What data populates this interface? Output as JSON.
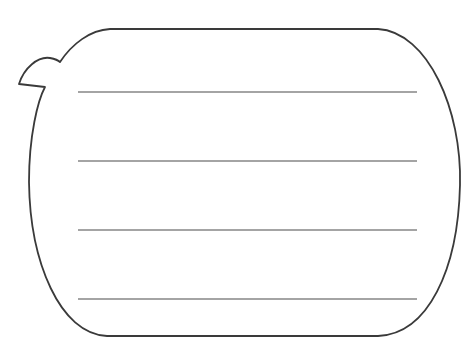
{
  "figure": {
    "type": "speech-bubble-writing-template",
    "stroke_color": "#3a3a3a",
    "line_color": "#4a4a4a",
    "background": "#ffffff",
    "ruled_line_count": 4,
    "ruled_lines_y": [
      92,
      161,
      230,
      299
    ],
    "ruled_line_x_start": 78,
    "ruled_line_x_end": 417
  }
}
